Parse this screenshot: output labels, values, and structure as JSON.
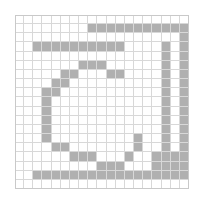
{
  "figure": {
    "type": "pixel-grid",
    "columns": 19,
    "rows": 19,
    "cell_size_px": 9.15,
    "origin_px": [
      15,
      15
    ],
    "colors": {
      "filled": "#b0b0b0",
      "empty": "#ffffff",
      "gridline": "#d8d8d8",
      "border": "#c9c9c9",
      "background": "#ffffff"
    }
  },
  "chart_data": {
    "type": "heatmap",
    "title": "",
    "xlabel": "",
    "ylabel": "",
    "categories": [],
    "grid": true,
    "legend": "none",
    "xlim": [
      0,
      19
    ],
    "ylim": [
      0,
      19
    ],
    "value_map": {
      "0": "empty",
      "1": "filled"
    },
    "matrix": [
      [
        0,
        0,
        0,
        0,
        0,
        0,
        0,
        0,
        0,
        0,
        0,
        0,
        0,
        0,
        0,
        0,
        0,
        0,
        0
      ],
      [
        0,
        0,
        0,
        0,
        0,
        0,
        0,
        0,
        1,
        1,
        1,
        1,
        1,
        1,
        1,
        1,
        1,
        1,
        1
      ],
      [
        0,
        0,
        0,
        0,
        0,
        0,
        0,
        0,
        0,
        0,
        0,
        0,
        0,
        0,
        0,
        0,
        0,
        0,
        1
      ],
      [
        0,
        0,
        1,
        1,
        1,
        1,
        1,
        1,
        1,
        1,
        1,
        1,
        0,
        0,
        0,
        0,
        1,
        0,
        1
      ],
      [
        0,
        0,
        0,
        0,
        0,
        0,
        0,
        0,
        0,
        0,
        0,
        0,
        0,
        0,
        0,
        0,
        1,
        0,
        1
      ],
      [
        0,
        0,
        0,
        0,
        0,
        0,
        0,
        1,
        1,
        1,
        0,
        0,
        0,
        0,
        0,
        0,
        1,
        0,
        1
      ],
      [
        0,
        0,
        0,
        0,
        0,
        1,
        1,
        0,
        0,
        0,
        1,
        1,
        0,
        0,
        0,
        0,
        1,
        0,
        1
      ],
      [
        0,
        0,
        0,
        0,
        1,
        1,
        0,
        0,
        0,
        0,
        0,
        0,
        0,
        0,
        0,
        0,
        1,
        0,
        1
      ],
      [
        0,
        0,
        0,
        1,
        1,
        0,
        0,
        0,
        0,
        0,
        0,
        0,
        0,
        0,
        0,
        0,
        1,
        0,
        1
      ],
      [
        0,
        0,
        0,
        1,
        0,
        0,
        0,
        0,
        0,
        0,
        0,
        0,
        0,
        0,
        0,
        0,
        1,
        0,
        1
      ],
      [
        0,
        0,
        0,
        1,
        0,
        0,
        0,
        0,
        0,
        0,
        0,
        0,
        0,
        0,
        0,
        0,
        1,
        0,
        1
      ],
      [
        0,
        0,
        0,
        1,
        0,
        0,
        0,
        0,
        0,
        0,
        0,
        0,
        0,
        0,
        0,
        0,
        1,
        0,
        1
      ],
      [
        0,
        0,
        0,
        1,
        0,
        0,
        0,
        0,
        0,
        0,
        0,
        0,
        0,
        0,
        0,
        0,
        1,
        0,
        1
      ],
      [
        0,
        0,
        0,
        1,
        0,
        0,
        0,
        0,
        0,
        0,
        0,
        0,
        0,
        1,
        0,
        0,
        1,
        0,
        1
      ],
      [
        0,
        0,
        0,
        0,
        1,
        1,
        0,
        0,
        0,
        0,
        0,
        0,
        0,
        1,
        0,
        0,
        1,
        0,
        1
      ],
      [
        0,
        0,
        0,
        0,
        0,
        0,
        1,
        1,
        1,
        0,
        0,
        0,
        1,
        0,
        0,
        1,
        1,
        1,
        1
      ],
      [
        0,
        0,
        0,
        0,
        0,
        0,
        0,
        0,
        0,
        1,
        1,
        1,
        0,
        0,
        0,
        1,
        1,
        1,
        1
      ],
      [
        0,
        0,
        1,
        1,
        1,
        1,
        1,
        1,
        1,
        1,
        1,
        1,
        1,
        1,
        1,
        1,
        1,
        1,
        1
      ],
      [
        0,
        0,
        0,
        0,
        0,
        0,
        0,
        0,
        0,
        0,
        0,
        0,
        0,
        0,
        0,
        0,
        0,
        0,
        0
      ]
    ]
  }
}
